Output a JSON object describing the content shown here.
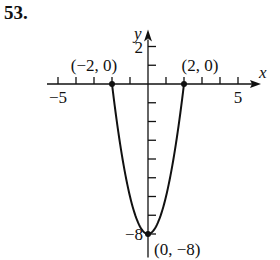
{
  "problem_number": "53.",
  "chart_data": {
    "type": "line",
    "title": "",
    "xlabel": "x",
    "ylabel": "y",
    "xlim": [
      -5.5,
      5.5
    ],
    "ylim": [
      -8.5,
      2.7
    ],
    "x_tick_labels": [
      {
        "value": -5,
        "label": "−5"
      },
      {
        "value": 5,
        "label": "5"
      }
    ],
    "y_tick_labels": [
      {
        "value": 2,
        "label": "2"
      },
      {
        "value": -8,
        "label": "−8"
      }
    ],
    "grid": false,
    "series": [
      {
        "name": "y = 2x^2 - 8",
        "function": "2x^2-8",
        "x_range": [
          -2,
          2
        ]
      }
    ],
    "points": [
      {
        "x": -2,
        "y": 0,
        "label": "(−2, 0)"
      },
      {
        "x": 2,
        "y": 0,
        "label": "(2, 0)"
      },
      {
        "x": 0,
        "y": -8,
        "label": "(0, −8)"
      }
    ]
  }
}
